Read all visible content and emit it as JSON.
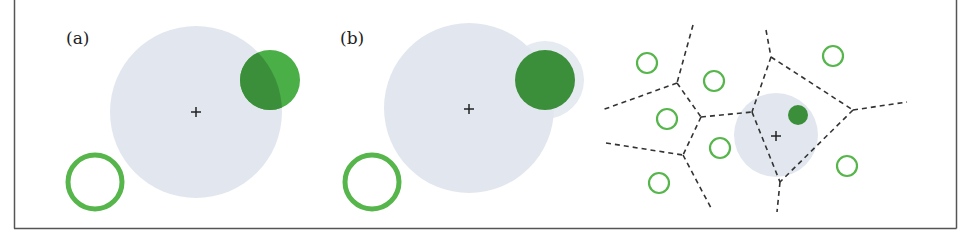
{
  "figure": {
    "frame": {
      "stroke": "#555555"
    },
    "colors": {
      "region_gray": "#e2e7ef",
      "region_gray_halo": "#e6eaf1",
      "green_bright": "#4aaf47",
      "green_dark": "#3c8f3a",
      "ring_green": "#56b54b",
      "dash": "#333333",
      "cross": "#222222"
    },
    "panels": [
      {
        "id": "a",
        "label": "(a)",
        "label_pos": [
          66,
          44
        ],
        "region": {
          "cx": 196,
          "cy": 112,
          "r": 86
        },
        "cross": {
          "x": 196,
          "y": 112
        },
        "filled_circle": {
          "cx": 270,
          "cy": 80,
          "r": 30,
          "overlap_darker": true
        },
        "ring": {
          "cx": 95,
          "cy": 182,
          "r": 27,
          "stroke_width": 5
        }
      },
      {
        "id": "b",
        "label": "(b)",
        "label_pos": [
          340,
          44
        ],
        "region": {
          "cx": 469,
          "cy": 108,
          "r": 85
        },
        "halo": {
          "cx": 545,
          "cy": 80,
          "r": 39
        },
        "cross": {
          "x": 469,
          "y": 109
        },
        "filled_circle": {
          "cx": 545,
          "cy": 80,
          "r": 30
        },
        "ring": {
          "cx": 372,
          "cy": 182,
          "r": 27,
          "stroke_width": 5
        }
      },
      {
        "id": "c",
        "label": "",
        "region": {
          "cx": 776,
          "cy": 135,
          "r": 42
        },
        "cross": {
          "x": 776,
          "y": 136
        },
        "filled_dot": {
          "cx": 798,
          "cy": 115,
          "r": 10
        },
        "small_rings": [
          {
            "cx": 647,
            "cy": 63,
            "r": 10
          },
          {
            "cx": 714,
            "cy": 81,
            "r": 10
          },
          {
            "cx": 667,
            "cy": 119,
            "r": 10
          },
          {
            "cx": 720,
            "cy": 148,
            "r": 10
          },
          {
            "cx": 659,
            "cy": 183,
            "r": 10
          },
          {
            "cx": 833,
            "cy": 56,
            "r": 10
          },
          {
            "cx": 847,
            "cy": 166,
            "r": 10
          }
        ],
        "voronoi_edges": [
          [
            [
              693,
              25
            ],
            [
              677,
              83
            ]
          ],
          [
            [
              677,
              83
            ],
            [
              602,
              110
            ]
          ],
          [
            [
              677,
              83
            ],
            [
              701,
              117
            ]
          ],
          [
            [
              701,
              117
            ],
            [
              683,
              155
            ]
          ],
          [
            [
              606,
              143
            ],
            [
              683,
              155
            ]
          ],
          [
            [
              683,
              155
            ],
            [
              711,
              208
            ]
          ],
          [
            [
              701,
              117
            ],
            [
              752,
              112
            ]
          ],
          [
            [
              766,
              30
            ],
            [
              771,
              57
            ]
          ],
          [
            [
              771,
              57
            ],
            [
              752,
              112
            ]
          ],
          [
            [
              771,
              57
            ],
            [
              853,
              110
            ]
          ],
          [
            [
              853,
              110
            ],
            [
              907,
              102
            ]
          ],
          [
            [
              853,
              110
            ],
            [
              780,
              182
            ]
          ],
          [
            [
              752,
              112
            ],
            [
              780,
              182
            ]
          ],
          [
            [
              780,
              182
            ],
            [
              777,
              212
            ]
          ]
        ]
      }
    ]
  }
}
